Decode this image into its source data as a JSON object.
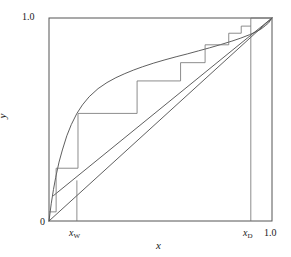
{
  "figure": {
    "kind": "mccabe-thiele-diagram",
    "line_color": "#4d4d4d",
    "frame_color": "#555555",
    "text_color": "#1a1a1a",
    "background": "#ffffff"
  },
  "labels": {
    "y_axis": "y",
    "x_axis": "x",
    "y_top": "1.0",
    "origin": "0",
    "x_right": "1.0",
    "x_w_symbol": "x",
    "x_w_subscript": "W",
    "x_d_symbol": "x",
    "x_d_subscript": "D"
  },
  "chart_data": {
    "type": "line",
    "title": "",
    "xlabel": "x",
    "ylabel": "y",
    "xlim": [
      0,
      1
    ],
    "ylim": [
      0,
      1
    ],
    "xticks": [
      0,
      0.125,
      0.905,
      1.0
    ],
    "xticklabels": [
      "0",
      "x_W",
      "x_D",
      "1.0"
    ],
    "yticks": [
      0,
      1.0
    ],
    "yticklabels": [
      "0",
      "1.0"
    ],
    "grid": false,
    "legend": "none",
    "series": [
      {
        "name": "equilibrium-curve",
        "type": "line",
        "x": [
          0.0,
          0.01,
          0.02,
          0.03,
          0.045,
          0.06,
          0.08,
          0.1,
          0.125,
          0.15,
          0.18,
          0.22,
          0.26,
          0.3,
          0.34,
          0.38,
          0.42,
          0.47,
          0.52,
          0.57,
          0.62,
          0.67,
          0.72,
          0.77,
          0.82,
          0.86,
          0.9,
          0.93,
          0.95,
          0.97,
          0.985,
          1.0
        ],
        "y": [
          0.0,
          0.085,
          0.155,
          0.215,
          0.29,
          0.35,
          0.42,
          0.475,
          0.53,
          0.572,
          0.612,
          0.652,
          0.682,
          0.706,
          0.726,
          0.744,
          0.76,
          0.778,
          0.794,
          0.809,
          0.823,
          0.838,
          0.853,
          0.869,
          0.886,
          0.901,
          0.918,
          0.933,
          0.945,
          0.962,
          0.976,
          1.0
        ]
      },
      {
        "name": "diagonal-45-line",
        "type": "line",
        "x": [
          0.0,
          1.0
        ],
        "y": [
          0.0,
          1.0
        ]
      },
      {
        "name": "operating-line",
        "type": "line",
        "x": [
          0.02,
          1.0
        ],
        "y": [
          0.125,
          1.0
        ]
      },
      {
        "name": "staircase-steps",
        "type": "line",
        "x": [
          1.0,
          0.905,
          0.905,
          0.862,
          0.862,
          0.806,
          0.806,
          0.7,
          0.7,
          0.59,
          0.59,
          0.395,
          0.395,
          0.13,
          0.13,
          0.032,
          0.032,
          0.0
        ],
        "y": [
          1.0,
          1.0,
          0.96,
          0.96,
          0.925,
          0.925,
          0.868,
          0.868,
          0.78,
          0.78,
          0.69,
          0.69,
          0.53,
          0.53,
          0.26,
          0.26,
          0.045,
          0.045
        ]
      },
      {
        "name": "xw-tick-line",
        "type": "line",
        "x": [
          0.125,
          0.125
        ],
        "y": [
          0.0,
          0.2
        ]
      },
      {
        "name": "xd-tick-line",
        "type": "line",
        "x": [
          0.905,
          0.905
        ],
        "y": [
          0.0,
          0.96
        ]
      }
    ]
  }
}
